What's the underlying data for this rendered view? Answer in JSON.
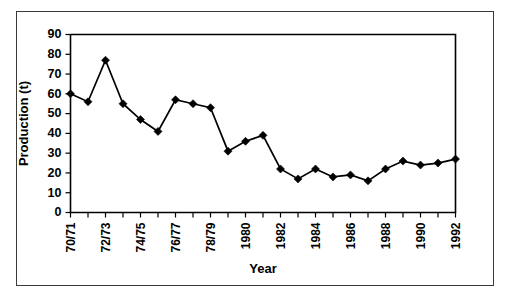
{
  "chart_data": {
    "type": "line",
    "title": "",
    "xlabel": "Year",
    "ylabel": "Production (t)",
    "ylim": [
      0,
      90
    ],
    "ytick_step": 10,
    "yticks": [
      "0",
      "10",
      "20",
      "30",
      "40",
      "50",
      "60",
      "70",
      "80",
      "90"
    ],
    "grid": false,
    "legend": "none",
    "marker": "filled-diamond",
    "line_color": "#000000",
    "marker_color": "#000000",
    "categories": [
      "70/71",
      "71/72",
      "72/73",
      "73/74",
      "74/75",
      "75/76",
      "76/77",
      "77/78",
      "78/79",
      "1979",
      "1980",
      "1981",
      "1982",
      "1983",
      "1984",
      "1985",
      "1986",
      "1987",
      "1988",
      "1989",
      "1990",
      "1991",
      "1992"
    ],
    "xtick_labels_shown": [
      "70/71",
      "",
      "72/73",
      "",
      "74/75",
      "",
      "76/77",
      "",
      "78/79",
      "",
      "1980",
      "",
      "1982",
      "",
      "1984",
      "",
      "1986",
      "",
      "1988",
      "",
      "1990",
      "",
      "1992"
    ],
    "values": [
      60,
      56,
      77,
      55,
      47,
      41,
      57,
      55,
      53,
      31,
      36,
      39,
      22,
      17,
      22,
      18,
      19,
      16,
      22,
      26,
      24,
      25,
      27
    ],
    "series": [
      {
        "name": "Production",
        "values": [
          60,
          56,
          77,
          55,
          47,
          41,
          57,
          55,
          53,
          31,
          36,
          39,
          22,
          17,
          22,
          18,
          19,
          16,
          22,
          26,
          24,
          25,
          27
        ]
      }
    ]
  },
  "figure": {
    "frame_color": "#3a3a3a",
    "background": "#ffffff"
  }
}
